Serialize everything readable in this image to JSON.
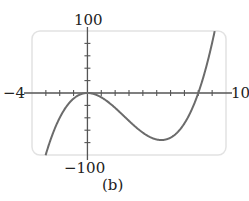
{
  "chart_data": {
    "type": "line",
    "title": "",
    "caption": "(b)",
    "xlabel": "",
    "ylabel": "",
    "xlim": [
      -4,
      10
    ],
    "ylim": [
      -100,
      100
    ],
    "x_tick_step": 1,
    "y_tick_step": 20,
    "grid": false,
    "axis_labels": {
      "xmin": "−4",
      "xmax": "10",
      "ymax": "100",
      "ymin": "−100"
    },
    "series": [
      {
        "name": "f(x) = x^3 - 8x^2",
        "x": [
          -4,
          -3,
          -2,
          -1,
          0,
          1,
          2,
          3,
          4,
          5,
          5.33,
          6,
          7,
          8,
          9,
          10
        ],
        "values": [
          -192,
          -99,
          -40,
          -9,
          0,
          -7,
          -24,
          -45,
          -64,
          -75,
          -75.9,
          -72,
          -49,
          0,
          81,
          200
        ]
      }
    ],
    "colors": {
      "curve": "#6b6b6b",
      "axis": "#555555",
      "frame": "#e2e2e2"
    }
  }
}
